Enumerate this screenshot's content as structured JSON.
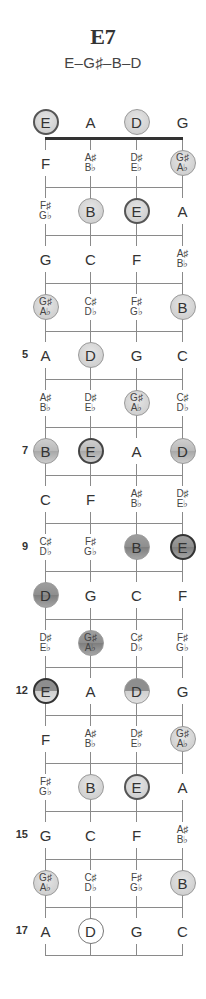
{
  "chord": {
    "name": "E7",
    "notes_formula": "E–G♯–B–D"
  },
  "strings": [
    {
      "name": "E",
      "x": 45
    },
    {
      "name": "A",
      "x": 90
    },
    {
      "name": "D",
      "x": 136
    },
    {
      "name": "G",
      "x": 182
    }
  ],
  "fret_numbers": [
    {
      "label": "5",
      "row": 5
    },
    {
      "label": "7",
      "row": 7
    },
    {
      "label": "9",
      "row": 9
    },
    {
      "label": "12",
      "row": 12
    },
    {
      "label": "15",
      "row": 15
    },
    {
      "label": "17",
      "row": 17
    }
  ],
  "rows": [
    {
      "fret": 0,
      "cells": [
        {
          "text": "E",
          "style": "root-light"
        },
        {
          "text": "A",
          "style": "plain"
        },
        {
          "text": "D",
          "style": "light"
        },
        {
          "text": "G",
          "style": "plain"
        }
      ]
    },
    {
      "fret": 1,
      "cells": [
        {
          "text": "F",
          "style": "plain"
        },
        {
          "sharp": "A♯",
          "flat": "B♭",
          "style": "plain"
        },
        {
          "sharp": "D♯",
          "flat": "E♭",
          "style": "plain"
        },
        {
          "sharp": "G♯",
          "flat": "A♭",
          "style": "light"
        }
      ]
    },
    {
      "fret": 2,
      "cells": [
        {
          "sharp": "F♯",
          "flat": "G♭",
          "style": "plain"
        },
        {
          "text": "B",
          "style": "light"
        },
        {
          "text": "E",
          "style": "root-light"
        },
        {
          "text": "A",
          "style": "plain"
        }
      ]
    },
    {
      "fret": 3,
      "cells": [
        {
          "text": "G",
          "style": "plain"
        },
        {
          "text": "C",
          "style": "plain"
        },
        {
          "text": "F",
          "style": "plain"
        },
        {
          "sharp": "A♯",
          "flat": "B♭",
          "style": "plain"
        }
      ]
    },
    {
      "fret": 4,
      "cells": [
        {
          "sharp": "G♯",
          "flat": "A♭",
          "style": "light"
        },
        {
          "sharp": "C♯",
          "flat": "D♭",
          "style": "plain"
        },
        {
          "sharp": "F♯",
          "flat": "G♭",
          "style": "plain"
        },
        {
          "text": "B",
          "style": "light"
        }
      ]
    },
    {
      "fret": 5,
      "cells": [
        {
          "text": "A",
          "style": "plain"
        },
        {
          "text": "D",
          "style": "light"
        },
        {
          "text": "G",
          "style": "plain"
        },
        {
          "text": "C",
          "style": "plain"
        }
      ]
    },
    {
      "fret": 6,
      "cells": [
        {
          "sharp": "A♯",
          "flat": "B♭",
          "style": "plain"
        },
        {
          "sharp": "D♯",
          "flat": "E♭",
          "style": "plain"
        },
        {
          "sharp": "G♯",
          "flat": "A♭",
          "style": "light"
        },
        {
          "sharp": "C♯",
          "flat": "D♭",
          "style": "plain"
        }
      ]
    },
    {
      "fret": 7,
      "cells": [
        {
          "text": "B",
          "style": "mid"
        },
        {
          "text": "E",
          "style": "root-mid"
        },
        {
          "text": "A",
          "style": "plain"
        },
        {
          "text": "D",
          "style": "mid"
        }
      ]
    },
    {
      "fret": 8,
      "cells": [
        {
          "text": "C",
          "style": "plain"
        },
        {
          "text": "F",
          "style": "plain"
        },
        {
          "sharp": "A♯",
          "flat": "B♭",
          "style": "plain"
        },
        {
          "sharp": "D♯",
          "flat": "E♭",
          "style": "plain"
        }
      ]
    },
    {
      "fret": 9,
      "cells": [
        {
          "sharp": "C♯",
          "flat": "D♭",
          "style": "plain"
        },
        {
          "sharp": "F♯",
          "flat": "G♭",
          "style": "plain"
        },
        {
          "text": "B",
          "style": "dark"
        },
        {
          "text": "E",
          "style": "root-dark"
        }
      ]
    },
    {
      "fret": 10,
      "cells": [
        {
          "text": "D",
          "style": "dark"
        },
        {
          "text": "G",
          "style": "plain"
        },
        {
          "text": "C",
          "style": "plain"
        },
        {
          "text": "F",
          "style": "plain"
        }
      ]
    },
    {
      "fret": 11,
      "cells": [
        {
          "sharp": "D♯",
          "flat": "E♭",
          "style": "plain"
        },
        {
          "sharp": "G♯",
          "flat": "A♭",
          "style": "dark"
        },
        {
          "sharp": "C♯",
          "flat": "D♭",
          "style": "plain"
        },
        {
          "sharp": "F♯",
          "flat": "G♭",
          "style": "plain"
        }
      ]
    },
    {
      "fret": 12,
      "cells": [
        {
          "text": "E",
          "style": "root-split"
        },
        {
          "text": "A",
          "style": "plain"
        },
        {
          "text": "D",
          "style": "split-dark"
        },
        {
          "text": "G",
          "style": "plain"
        }
      ]
    },
    {
      "fret": 13,
      "cells": [
        {
          "text": "F",
          "style": "plain"
        },
        {
          "sharp": "A♯",
          "flat": "B♭",
          "style": "plain"
        },
        {
          "sharp": "D♯",
          "flat": "E♭",
          "style": "plain"
        },
        {
          "sharp": "G♯",
          "flat": "A♭",
          "style": "light"
        }
      ]
    },
    {
      "fret": 14,
      "cells": [
        {
          "sharp": "F♯",
          "flat": "G♭",
          "style": "plain"
        },
        {
          "text": "B",
          "style": "light"
        },
        {
          "text": "E",
          "style": "root-light"
        },
        {
          "text": "A",
          "style": "plain"
        }
      ]
    },
    {
      "fret": 15,
      "cells": [
        {
          "text": "G",
          "style": "plain"
        },
        {
          "text": "C",
          "style": "plain"
        },
        {
          "text": "F",
          "style": "plain"
        },
        {
          "sharp": "A♯",
          "flat": "B♭",
          "style": "plain"
        }
      ]
    },
    {
      "fret": 16,
      "cells": [
        {
          "sharp": "G♯",
          "flat": "A♭",
          "style": "light"
        },
        {
          "sharp": "C♯",
          "flat": "D♭",
          "style": "plain"
        },
        {
          "sharp": "F♯",
          "flat": "G♭",
          "style": "plain"
        },
        {
          "text": "B",
          "style": "light"
        }
      ]
    },
    {
      "fret": 17,
      "cells": [
        {
          "text": "A",
          "style": "plain"
        },
        {
          "text": "D",
          "style": "open-white"
        },
        {
          "text": "G",
          "style": "plain"
        },
        {
          "text": "C",
          "style": "plain"
        }
      ]
    }
  ],
  "colors": {
    "line": "#8a8a8a",
    "nut": "#333333",
    "text": "#333333"
  }
}
